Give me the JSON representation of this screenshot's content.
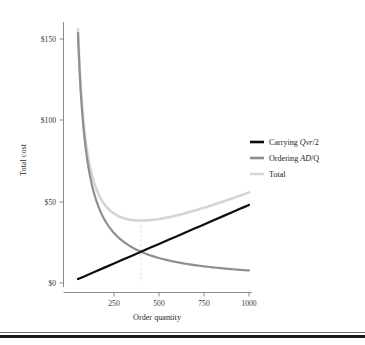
{
  "figure": {
    "title": "",
    "y_axis_title": "Total cost",
    "x_axis_title": "Order quantity",
    "x_ticks": [
      "250",
      "500",
      "750",
      "1000"
    ],
    "y_ticks": [
      "$0",
      "$50",
      "$100",
      "$150"
    ]
  },
  "legend": {
    "position": "right",
    "entries": [
      {
        "label_prefix": "Carrying ",
        "label_math": "Qvr",
        "label_suffix": "/2",
        "color": "#0d0d0d"
      },
      {
        "label_prefix": "Ordering ",
        "label_math": "AD",
        "label_suffix": "/Q",
        "color": "#8f8f8f"
      },
      {
        "label_prefix": "Total",
        "label_math": "",
        "label_suffix": "",
        "color": "#d5d5d5"
      }
    ]
  },
  "annotations": {
    "eoq_guide_x": 400,
    "eoq_guide_label": ""
  },
  "chart_data": {
    "type": "line",
    "title": "",
    "xlabel": "Order quantity",
    "ylabel": "Total cost",
    "xlim": [
      50,
      1000
    ],
    "ylim": [
      0,
      160
    ],
    "y_tick_values": [
      0,
      50,
      100,
      150
    ],
    "x_tick_values": [
      250,
      500,
      750,
      1000
    ],
    "grid": false,
    "legend_position": "right",
    "annotations": [
      {
        "type": "vline",
        "x": 400,
        "style": "dashed",
        "color": "#d9d9d9",
        "note": "EOQ: carrying cost equals ordering cost"
      }
    ],
    "series": [
      {
        "name": "Carrying Qvr/2",
        "color": "#0d0d0d",
        "linewidth": 2.2,
        "formula": "Q*v*r/2",
        "x": [
          50,
          100,
          150,
          200,
          250,
          300,
          350,
          400,
          450,
          500,
          550,
          600,
          650,
          700,
          750,
          800,
          850,
          900,
          950,
          1000
        ],
        "y": [
          2.4,
          4.8,
          7.2,
          9.6,
          12.0,
          14.4,
          16.8,
          19.2,
          21.6,
          24.0,
          26.4,
          28.8,
          31.2,
          33.6,
          36.0,
          38.4,
          40.8,
          43.2,
          45.6,
          48.0
        ]
      },
      {
        "name": "Ordering AD/Q",
        "color": "#8f8f8f",
        "linewidth": 2.2,
        "formula": "A*D/Q",
        "x": [
          50,
          100,
          150,
          200,
          250,
          300,
          350,
          400,
          450,
          500,
          550,
          600,
          650,
          700,
          750,
          800,
          850,
          900,
          950,
          1000
        ],
        "y": [
          153.6,
          76.8,
          51.2,
          38.4,
          30.7,
          25.6,
          21.9,
          19.2,
          17.1,
          15.4,
          14.0,
          12.8,
          11.8,
          11.0,
          10.2,
          9.6,
          9.0,
          8.5,
          8.1,
          7.7
        ]
      },
      {
        "name": "Total",
        "color": "#d5d5d5",
        "linewidth": 2.6,
        "formula": "Q*v*r/2 + A*D/Q",
        "x": [
          50,
          100,
          150,
          200,
          250,
          300,
          350,
          400,
          450,
          500,
          550,
          600,
          650,
          700,
          750,
          800,
          850,
          900,
          950,
          1000
        ],
        "y": [
          156.0,
          81.6,
          58.4,
          48.0,
          42.7,
          40.0,
          38.7,
          38.4,
          38.7,
          39.4,
          40.4,
          41.6,
          43.0,
          44.6,
          46.2,
          48.0,
          49.8,
          51.7,
          53.7,
          55.7
        ]
      }
    ]
  }
}
